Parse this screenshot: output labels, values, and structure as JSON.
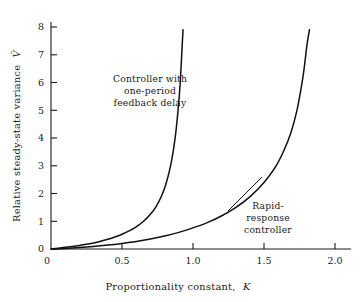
{
  "figure": {
    "background": "#ffffff",
    "ink_color": "#111111"
  },
  "chart_data": {
    "type": "line",
    "title": "",
    "xlabel_text": "Proportionality constant,",
    "xlabel_symbol": "K",
    "ylabel_text": "Relative steady-state variance",
    "ylabel_symbol": "V̂",
    "xlim": [
      0,
      2.1
    ],
    "ylim": [
      0,
      8.4
    ],
    "xticks": [
      0,
      0.5,
      1.0,
      1.5,
      2.0
    ],
    "xticklabels": [
      "0",
      "0.5",
      "1.0",
      "1.5",
      "2.0"
    ],
    "yticks": [
      0,
      1,
      2,
      3,
      4,
      5,
      6,
      7,
      8
    ],
    "yticklabels": [
      "0",
      "1",
      "2",
      "3",
      "4",
      "5",
      "6",
      "7",
      "8"
    ],
    "grid": false,
    "legend_position": "inline-annotations",
    "series": [
      {
        "name": "Controller with one-period feedback delay",
        "asymptote_K": 0.96,
        "x": [
          0.0,
          0.05,
          0.1,
          0.15,
          0.2,
          0.25,
          0.3,
          0.35,
          0.4,
          0.45,
          0.5,
          0.55,
          0.6,
          0.65,
          0.7,
          0.74,
          0.78,
          0.81,
          0.84,
          0.86,
          0.88,
          0.9,
          0.91,
          0.92,
          0.925,
          0.93
        ],
        "values": [
          0.0,
          0.03,
          0.06,
          0.09,
          0.13,
          0.17,
          0.22,
          0.28,
          0.35,
          0.43,
          0.53,
          0.65,
          0.8,
          0.99,
          1.25,
          1.53,
          1.93,
          2.35,
          2.95,
          3.5,
          4.25,
          5.3,
          6.0,
          6.95,
          7.45,
          7.9
        ]
      },
      {
        "name": "Rapid-response controller",
        "asymptote_K": 1.88,
        "x": [
          0.0,
          0.1,
          0.2,
          0.3,
          0.4,
          0.5,
          0.6,
          0.7,
          0.8,
          0.9,
          1.0,
          1.1,
          1.2,
          1.3,
          1.4,
          1.5,
          1.58,
          1.64,
          1.69,
          1.73,
          1.76,
          1.78,
          1.8,
          1.81,
          1.82
        ],
        "values": [
          0.0,
          0.02,
          0.05,
          0.09,
          0.14,
          0.2,
          0.27,
          0.36,
          0.47,
          0.6,
          0.76,
          0.95,
          1.19,
          1.49,
          1.88,
          2.4,
          2.95,
          3.55,
          4.2,
          4.95,
          5.75,
          6.4,
          7.25,
          7.6,
          7.9
        ]
      }
    ],
    "annotations": [
      {
        "id": "annotation-delay",
        "lines": [
          "Controller with",
          "one-period",
          "feedback delay"
        ],
        "align": "center"
      },
      {
        "id": "annotation-rapid",
        "lines": [
          "Rapid-",
          "response",
          "controller"
        ],
        "align": "center"
      }
    ]
  }
}
